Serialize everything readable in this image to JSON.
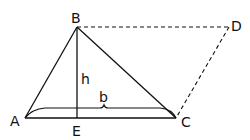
{
  "diagram": {
    "type": "geometry",
    "points": {
      "A": {
        "label": "A",
        "x": 25,
        "y": 118
      },
      "B": {
        "label": "B",
        "x": 77,
        "y": 27
      },
      "C": {
        "label": "C",
        "x": 176,
        "y": 118
      },
      "D": {
        "label": "D",
        "x": 229,
        "y": 27
      },
      "E": {
        "label": "E",
        "x": 77,
        "y": 118
      }
    },
    "labels": {
      "height": "h",
      "base": "b"
    },
    "colors": {
      "stroke": "#111111",
      "background": "#ffffff"
    }
  }
}
